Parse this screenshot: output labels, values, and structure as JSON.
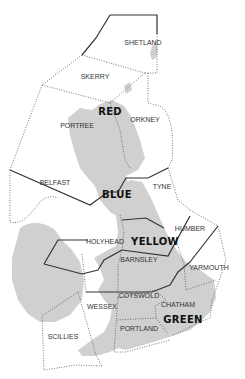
{
  "map": {
    "title": "UK sea areas / regions map",
    "areas": [
      {
        "name": "SHETLAND",
        "x": 143,
        "y": 45
      },
      {
        "name": "SKERRY",
        "x": 95,
        "y": 79
      },
      {
        "name": "PORTREE",
        "x": 77,
        "y": 128
      },
      {
        "name": "ORKNEY",
        "x": 145,
        "y": 122
      },
      {
        "name": "BELFAST",
        "x": 55,
        "y": 185
      },
      {
        "name": "TYNE",
        "x": 162,
        "y": 189
      },
      {
        "name": "HUMBER",
        "x": 190,
        "y": 231
      },
      {
        "name": "HOLYHEAD",
        "x": 105,
        "y": 244
      },
      {
        "name": "BARNSLEY",
        "x": 139,
        "y": 262
      },
      {
        "name": "YARMOUTH",
        "x": 209,
        "y": 270
      },
      {
        "name": "COTSWOLD",
        "x": 139,
        "y": 298
      },
      {
        "name": "WESSEX",
        "x": 102,
        "y": 309
      },
      {
        "name": "CHATHAM",
        "x": 178,
        "y": 307
      },
      {
        "name": "PORTLAND",
        "x": 139,
        "y": 331
      },
      {
        "name": "SCILLIES",
        "x": 63,
        "y": 339
      }
    ],
    "regions": [
      {
        "name": "RED",
        "x": 110,
        "y": 115,
        "color": "#111111"
      },
      {
        "name": "BLUE",
        "x": 117,
        "y": 198,
        "color": "#111111"
      },
      {
        "name": "YELLOW",
        "x": 155,
        "y": 245,
        "color": "#111111"
      },
      {
        "name": "GREEN",
        "x": 183,
        "y": 323,
        "color": "#111111"
      }
    ],
    "colors": {
      "land": "#d0d0d0",
      "background": "#ffffff",
      "boundary": "#333333"
    }
  }
}
